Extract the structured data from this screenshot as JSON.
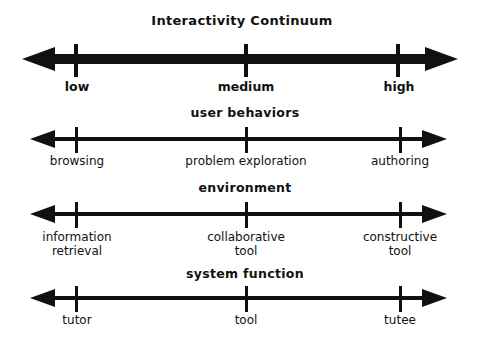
{
  "title": "Interactivity Continuum",
  "colors": {
    "ink": "#111111",
    "background": "#ffffff"
  },
  "continua": [
    {
      "name": "interactivity",
      "heading": "Interactivity Continuum",
      "labels": [
        "low",
        "medium",
        "high"
      ]
    },
    {
      "name": "user-behaviors",
      "heading": "user behaviors",
      "labels": [
        "browsing",
        "problem exploration",
        "authoring"
      ]
    },
    {
      "name": "environment",
      "heading": "environment",
      "labels": [
        "information\nretrieval",
        "collaborative\ntool",
        "constructive\ntool"
      ],
      "label_lines": [
        [
          "information",
          "retrieval"
        ],
        [
          "collaborative",
          "tool"
        ],
        [
          "constructive",
          "tool"
        ]
      ]
    },
    {
      "name": "system-function",
      "heading": "system function",
      "labels": [
        "tutor",
        "tool",
        "tutee"
      ]
    }
  ]
}
